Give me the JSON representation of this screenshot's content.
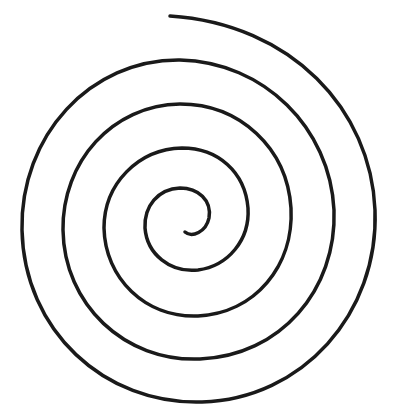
{
  "figure": {
    "type": "spiral",
    "stroke_color": "#1a1a1a",
    "background_color": "#ffffff",
    "stroke_width": 3.5,
    "turns": 4.5
  }
}
